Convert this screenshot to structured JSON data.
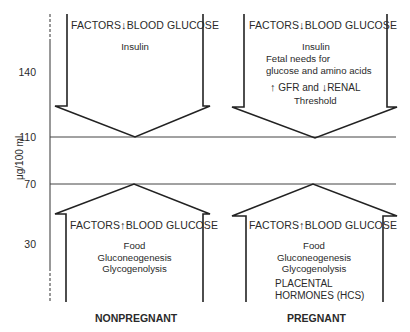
{
  "axis": {
    "label": "μg/100 ml",
    "ticks": [
      "140",
      "110",
      "70",
      "30"
    ]
  },
  "thresholds": {
    "upper": "110",
    "lower": "70"
  },
  "columns": [
    {
      "condition": "NONPREGNANT",
      "decrease_box": {
        "header_left": "FACTORS",
        "header_arrow": "↓",
        "header_right": "BLOOD GLUCOSE",
        "lines": [
          "Insulin"
        ]
      },
      "increase_box": {
        "header_left": "FACTORS",
        "header_arrow": "↑",
        "header_right": "BLOOD GLUCOSE",
        "lines": [
          "Food",
          "Gluconeogenesis",
          "Glycogenolysis"
        ]
      }
    },
    {
      "condition": "PREGNANT",
      "decrease_box": {
        "header_left": "FACTORS",
        "header_arrow": "↓",
        "header_right": "BLOOD GLUCOSE",
        "lines": [
          "Insulin",
          "Fetal needs for",
          "glucose and amino acids"
        ],
        "gfr_line": {
          "up_arrow": "↑",
          "part1": "GFR and",
          "down_arrow": "↓",
          "part2": "RENAL"
        },
        "last_line": "Threshold"
      },
      "increase_box": {
        "header_left": "FACTORS",
        "header_arrow": "↑",
        "header_right": "BLOOD GLUCOSE",
        "lines": [
          "Food",
          "Gluconeogenesis",
          "Glycogenolysis"
        ],
        "extra_lines": [
          "PLACENTAL",
          "HORMONES (HCS)"
        ]
      }
    }
  ]
}
